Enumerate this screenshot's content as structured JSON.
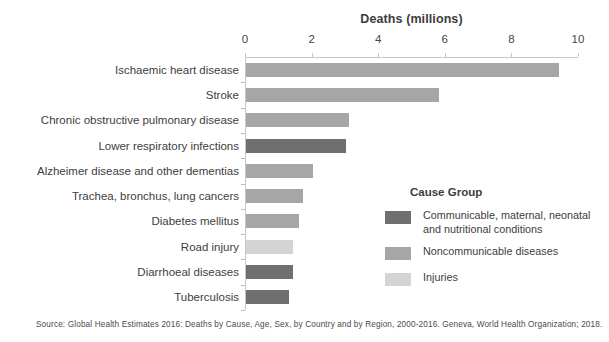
{
  "chart_data": {
    "type": "bar",
    "orientation": "horizontal",
    "title": "Deaths (millions)",
    "xlabel": "Deaths (millions)",
    "ylabel": "",
    "xlim": [
      0,
      10
    ],
    "xticks": [
      0,
      2,
      4,
      6,
      8,
      10
    ],
    "grid": false,
    "categories": [
      "Ischaemic heart disease",
      "Stroke",
      "Chronic obstructive pulmonary disease",
      "Lower respiratory infections",
      "Alzheimer disease and other dementias",
      "Trachea, bronchus, lung cancers",
      "Diabetes mellitus",
      "Road injury",
      "Diarrhoeal diseases",
      "Tuberculosis"
    ],
    "values": [
      9.4,
      5.8,
      3.1,
      3.0,
      2.0,
      1.7,
      1.6,
      1.4,
      1.4,
      1.3
    ],
    "groups": [
      "noncommunicable",
      "noncommunicable",
      "noncommunicable",
      "communicable",
      "noncommunicable",
      "noncommunicable",
      "noncommunicable",
      "injuries",
      "communicable",
      "communicable"
    ],
    "legend_position": "right"
  },
  "legend": {
    "title": "Cause Group",
    "items": [
      {
        "key": "communicable",
        "label": "Communicable, maternal, neonatal and nutritional conditions",
        "color": "#6f6f6f"
      },
      {
        "key": "noncommunicable",
        "label": "Noncommunicable diseases",
        "color": "#a6a6a6"
      },
      {
        "key": "injuries",
        "label": "Injuries",
        "color": "#d4d4d4"
      }
    ]
  },
  "colors": {
    "communicable": "#6f6f6f",
    "noncommunicable": "#a6a6a6",
    "injuries": "#d4d4d4",
    "axis": "#c8c8c8",
    "text": "#404040"
  },
  "source": {
    "text": "Source: Global Health Estimates 2016: Deaths by Cause, Age, Sex, by Country and by Region, 2000-2016. Geneva, World Health Organization; 2018."
  }
}
